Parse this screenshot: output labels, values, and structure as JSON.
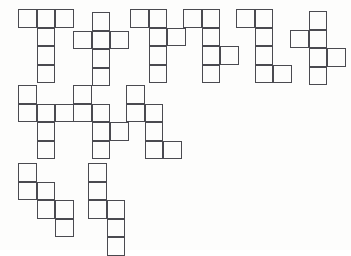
{
  "figure": {
    "background_color": "#fdfdfc",
    "stroke_color": "#4a4a50",
    "fill_color": "transparent",
    "cell_size_px": 18.5,
    "stroke_width_px": 1.15,
    "shape_count": 11,
    "cells_per_shape": 6,
    "shapes": [
      {
        "id": "net-1",
        "name": "T-net",
        "origin": [
          18,
          9
        ],
        "cells": [
          [
            0,
            0
          ],
          [
            1,
            0
          ],
          [
            2,
            0
          ],
          [
            1,
            1
          ],
          [
            1,
            2
          ],
          [
            1,
            3
          ]
        ]
      },
      {
        "id": "net-2",
        "name": "plus-net",
        "origin": [
          73,
          12
        ],
        "cells": [
          [
            1,
            0
          ],
          [
            0,
            1
          ],
          [
            1,
            1
          ],
          [
            2,
            1
          ],
          [
            1,
            2
          ],
          [
            1,
            3
          ]
        ]
      },
      {
        "id": "net-3",
        "name": "offset-T-net",
        "origin": [
          130,
          9
        ],
        "cells": [
          [
            0,
            0
          ],
          [
            1,
            0
          ],
          [
            1,
            1
          ],
          [
            2,
            1
          ],
          [
            1,
            2
          ],
          [
            1,
            3
          ]
        ]
      },
      {
        "id": "net-4",
        "name": "side-step-net",
        "origin": [
          183,
          9
        ],
        "cells": [
          [
            0,
            0
          ],
          [
            1,
            0
          ],
          [
            1,
            1
          ],
          [
            1,
            2
          ],
          [
            2,
            2
          ],
          [
            1,
            3
          ]
        ]
      },
      {
        "id": "net-5",
        "name": "L-net",
        "origin": [
          236,
          9
        ],
        "cells": [
          [
            0,
            0
          ],
          [
            1,
            0
          ],
          [
            1,
            1
          ],
          [
            1,
            2
          ],
          [
            1,
            3
          ],
          [
            2,
            3
          ]
        ]
      },
      {
        "id": "net-6",
        "name": "zigzag-cross-net",
        "origin": [
          290,
          11
        ],
        "cells": [
          [
            1,
            0
          ],
          [
            0,
            1
          ],
          [
            1,
            1
          ],
          [
            1,
            2
          ],
          [
            2,
            2
          ],
          [
            1,
            3
          ]
        ]
      },
      {
        "id": "net-7",
        "name": "corner-plus-net",
        "origin": [
          18,
          85
        ],
        "cells": [
          [
            0,
            0
          ],
          [
            0,
            1
          ],
          [
            1,
            1
          ],
          [
            2,
            1
          ],
          [
            1,
            2
          ],
          [
            1,
            3
          ]
        ]
      },
      {
        "id": "net-8",
        "name": "s-step-net",
        "origin": [
          73,
          85
        ],
        "cells": [
          [
            0,
            0
          ],
          [
            0,
            1
          ],
          [
            1,
            1
          ],
          [
            1,
            2
          ],
          [
            2,
            2
          ],
          [
            1,
            3
          ]
        ]
      },
      {
        "id": "net-9",
        "name": "double-step-net",
        "origin": [
          126,
          85
        ],
        "cells": [
          [
            0,
            0
          ],
          [
            0,
            1
          ],
          [
            1,
            1
          ],
          [
            1,
            2
          ],
          [
            1,
            3
          ],
          [
            2,
            3
          ]
        ]
      },
      {
        "id": "net-10",
        "name": "staircase-net",
        "origin": [
          18,
          163
        ],
        "cells": [
          [
            0,
            0
          ],
          [
            0,
            1
          ],
          [
            1,
            1
          ],
          [
            1,
            2
          ],
          [
            2,
            2
          ],
          [
            2,
            3
          ]
        ]
      },
      {
        "id": "net-11",
        "name": "tall-step-net",
        "origin": [
          88,
          163
        ],
        "cells": [
          [
            0,
            0
          ],
          [
            0,
            1
          ],
          [
            0,
            2
          ],
          [
            1,
            2
          ],
          [
            1,
            3
          ],
          [
            1,
            4
          ]
        ]
      }
    ]
  }
}
